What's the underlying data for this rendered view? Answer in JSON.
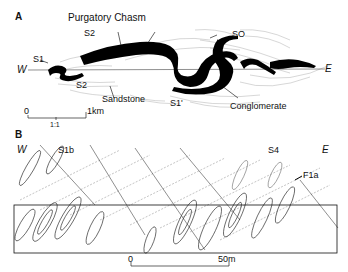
{
  "panel_a": {
    "label": "A",
    "west": "W",
    "east": "E",
    "labels": {
      "purgatory_chasm": "Purgatory Chasm",
      "s2_upper": "S2",
      "s2_lower": "S2",
      "s1_left": "S1",
      "s0": "SO",
      "s1_prime": "S1'",
      "sandstone": "Sandstone",
      "conglomerate": "Conglomerate"
    },
    "scale_bar": {
      "start": "0",
      "end": "1km",
      "ratio": "1:1"
    }
  },
  "panel_b": {
    "label": "B",
    "west": "W",
    "east": "E",
    "labels": {
      "s1b": "S1b",
      "s4": "S4",
      "f1a": "F1a"
    },
    "scale_bar": {
      "start": "0",
      "end": "50m"
    }
  }
}
